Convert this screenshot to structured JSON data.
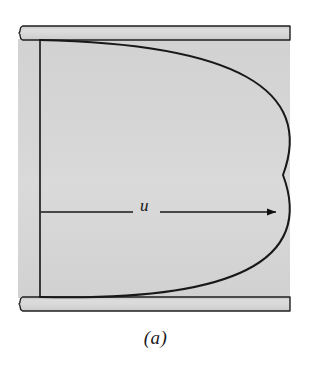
{
  "figure": {
    "caption": "(a)",
    "velocity_label": "u",
    "colors": {
      "channel_fill": "#d4d4d4",
      "plate_fill": "#cfcfcf",
      "plate_fill_light": "#dcdcdc",
      "line": "#1a1a1a",
      "background": "#ffffff"
    },
    "geometry": {
      "channel_left_x": 18,
      "channel_right_x": 290,
      "axis_x": 40,
      "top_plate_top_y": 26,
      "top_plate_bottom_y": 40,
      "bottom_plate_top_y": 297,
      "bottom_plate_bottom_y": 311,
      "parabola_vertex_x": 283,
      "parabola_vertex_y": 175,
      "arrow_y": 212,
      "arrow_start_x": 40,
      "arrow_end_x": 276
    },
    "elements": {
      "top_plate": "top-plate",
      "bottom_plate": "bottom-plate",
      "channel": "channel-region",
      "profile_curve": "velocity-profile-parabola",
      "axis": "vertical-reference-axis",
      "arrow": "velocity-vector-arrow",
      "break_left_top": "top-plate-break-edge",
      "break_left_bottom": "bottom-plate-break-edge"
    }
  }
}
